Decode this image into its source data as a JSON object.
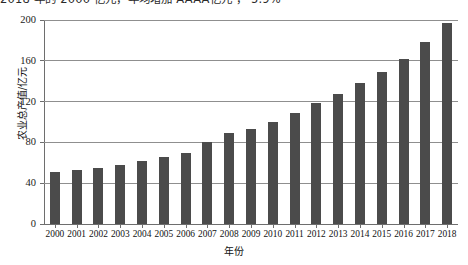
{
  "top_fragment": "2018 年的 2000 亿元，年均增加 AAAA亿元 ， 5.9%",
  "chart_data": {
    "type": "bar",
    "title": "",
    "xlabel": "年份",
    "ylabel": "农业总产值/亿元",
    "categories": [
      "2000",
      "2001",
      "2002",
      "2003",
      "2004",
      "2005",
      "2006",
      "2007",
      "2008",
      "2009",
      "2010",
      "2011",
      "2012",
      "2013",
      "2014",
      "2015",
      "2016",
      "2017",
      "2018"
    ],
    "values": [
      51,
      53,
      55,
      58,
      62,
      66,
      70,
      80,
      89,
      93,
      100,
      109,
      119,
      127,
      138,
      149,
      162,
      178,
      197
    ],
    "ylim": [
      0,
      200
    ],
    "yticks": [
      0,
      40,
      80,
      120,
      160,
      200
    ],
    "ytick_labels": [
      "0",
      "40",
      "80",
      "120",
      "160",
      "200"
    ],
    "grid": true,
    "legend": "none",
    "bar_color": "#4b4b4b",
    "axis_color": "#6e6e6e",
    "grid_color": "#8f8f8f"
  }
}
